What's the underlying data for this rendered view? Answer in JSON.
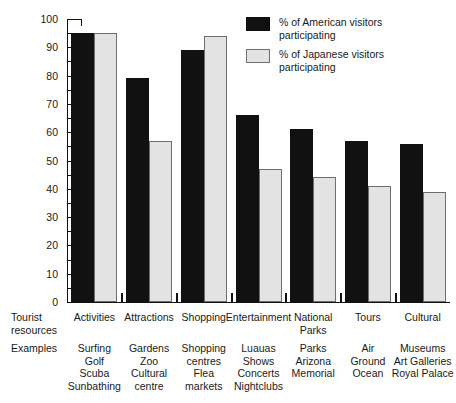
{
  "chart_data": {
    "type": "bar",
    "title": "",
    "xlabel": "",
    "ylabel": "",
    "ylim": [
      0,
      100
    ],
    "ytick_step": 10,
    "minor_tick_step": 5,
    "grid": false,
    "legend_position": "top-right",
    "yticks": [
      "100",
      "90",
      "80",
      "70",
      "60",
      "50",
      "40",
      "30",
      "20",
      "10",
      "0"
    ],
    "categories": [
      "Activities",
      "Attractions",
      "Shopping",
      "Entertainment",
      "National\nParks",
      "Tours",
      "Cultural"
    ],
    "series": [
      {
        "name": "% of American visitors\nparticipating",
        "color": "#111111",
        "values": [
          95,
          79,
          89,
          66,
          61,
          57,
          56
        ]
      },
      {
        "name": "% of Japanese visitors\nparticipating",
        "color": "#e3e3e3",
        "values": [
          95,
          57,
          94,
          47,
          44,
          41,
          39
        ]
      }
    ],
    "row_labels": {
      "resources": "Tourist\nresources",
      "examples": "Examples"
    },
    "examples": [
      "Surfing\nGolf\nScuba\nSunbathing",
      "Gardens\nZoo\nCultural\ncentre",
      "Shopping\ncentres\nFlea\nmarkets",
      "Luauas\nShows\nConcerts\nNightclubs",
      "Parks\nArizona\nMemorial",
      "Air\nGround\nOcean",
      "Museums\nArt Galleries\nRoyal Palace"
    ]
  }
}
